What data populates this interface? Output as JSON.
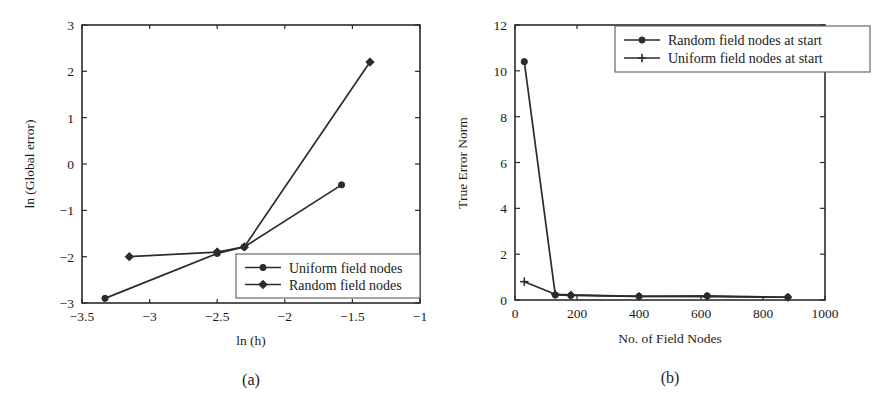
{
  "figure": {
    "background_color": "#ffffff",
    "ink_color": "#2b2b2b",
    "panel_a_caption": "(a)",
    "panel_b_caption": "(b)"
  },
  "chart_data": [
    {
      "id": "panel-a",
      "type": "line",
      "title": "",
      "caption": "(a)",
      "xlabel": "ln (h)",
      "ylabel": "ln (Global error)",
      "xlim": [
        -3.5,
        -1.0
      ],
      "ylim": [
        -3,
        3
      ],
      "xticks": [
        -3.5,
        -3,
        -2.5,
        -2,
        -1.5,
        -1
      ],
      "xtick_labels": [
        "−3.5",
        "−3",
        "−2.5",
        "−2",
        "−1.5",
        "−1"
      ],
      "yticks": [
        -3,
        -2,
        -1,
        0,
        1,
        2,
        3
      ],
      "ytick_labels": [
        "−3",
        "−2",
        "−1",
        "0",
        "1",
        "2",
        "3"
      ],
      "grid": false,
      "legend_position": "lower right",
      "series": [
        {
          "name": "Uniform field nodes",
          "marker": "circle",
          "x": [
            -3.33,
            -2.5,
            -2.3,
            -1.58
          ],
          "y": [
            -2.9,
            -1.93,
            -1.79,
            -0.45
          ]
        },
        {
          "name": "Random field nodes",
          "marker": "diamond",
          "x": [
            -3.15,
            -2.5,
            -2.3,
            -1.37
          ],
          "y": [
            -2.0,
            -1.9,
            -1.79,
            2.2
          ]
        }
      ]
    },
    {
      "id": "panel-b",
      "type": "line",
      "title": "",
      "caption": "(b)",
      "xlabel": "No. of Field Nodes",
      "ylabel": "True Error Norm",
      "xlim": [
        0,
        1000
      ],
      "ylim": [
        0,
        12
      ],
      "xticks": [
        0,
        200,
        400,
        600,
        800,
        1000
      ],
      "xtick_labels": [
        "0",
        "200",
        "400",
        "600",
        "800",
        "1000"
      ],
      "yticks": [
        0,
        2,
        4,
        6,
        8,
        10,
        12
      ],
      "ytick_labels": [
        "0",
        "2",
        "4",
        "6",
        "8",
        "10",
        "12"
      ],
      "grid": false,
      "legend_position": "upper right",
      "series": [
        {
          "name": "Random field nodes at start",
          "marker": "circle",
          "x": [
            30,
            130,
            180,
            400,
            620,
            880
          ],
          "y": [
            10.4,
            0.22,
            0.2,
            0.16,
            0.18,
            0.12
          ]
        },
        {
          "name": "Uniform field nodes at start",
          "marker": "plus",
          "x": [
            30,
            130,
            180,
            400,
            620,
            880
          ],
          "y": [
            0.8,
            0.25,
            0.22,
            0.16,
            0.15,
            0.12
          ]
        }
      ]
    }
  ]
}
